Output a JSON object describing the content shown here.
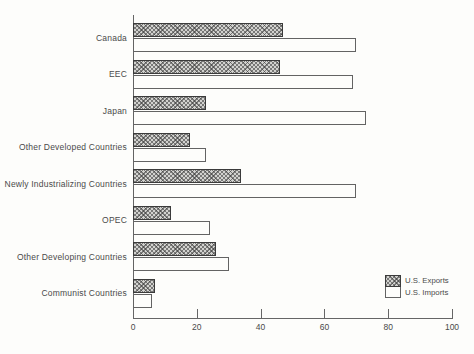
{
  "chart_data": {
    "type": "bar",
    "orientation": "horizontal",
    "title": "",
    "xlabel": "",
    "ylabel": "",
    "categories": [
      "Canada",
      "EEC",
      "Japan",
      "Other Developed Countries",
      "Newly Industrializing Countries",
      "OPEC",
      "Other Developing Countries",
      "Communist Countries"
    ],
    "series": [
      {
        "name": "U.S. Exports",
        "values": [
          47,
          46,
          23,
          18,
          34,
          12,
          26,
          7
        ]
      },
      {
        "name": "U.S. Imports",
        "values": [
          70,
          69,
          73,
          23,
          70,
          24,
          30,
          6
        ]
      }
    ],
    "xlim": [
      0,
      100
    ],
    "xticks": [
      0,
      20,
      40,
      60,
      80,
      100
    ],
    "grid": false,
    "legend_position": "bottom-right"
  },
  "colors": {
    "background": "#fdfdfb",
    "axis": "#666666",
    "text": "#4a4a4a",
    "export_fill": "#d2d2cf",
    "export_hatch": "rgba(60,60,60,0.6)",
    "export_border": "#3b3b3b",
    "import_fill": "#fdfdfb",
    "import_border": "#636363"
  }
}
